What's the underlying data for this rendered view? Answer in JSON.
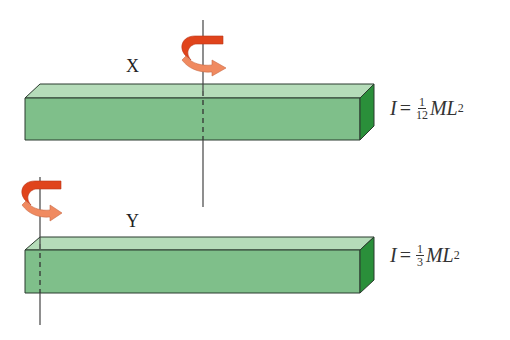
{
  "figure": {
    "colors": {
      "rod_front": "#7fbf8a",
      "rod_top": "#b5dcb9",
      "rod_end": "#2a8f3a",
      "rod_edge": "#2b3b2e",
      "arrow_dark": "#e0441c",
      "arrow_light": "#f08a60",
      "axis": "#444444"
    },
    "rods": [
      {
        "label": "X",
        "axis_position": "center",
        "formula": {
          "lhs": "I",
          "equals": "=",
          "numerator": "1",
          "denominator": "12",
          "rhs_base": "ML",
          "exponent": "2"
        }
      },
      {
        "label": "Y",
        "axis_position": "end",
        "formula": {
          "lhs": "I",
          "equals": "=",
          "numerator": "1",
          "denominator": "3",
          "rhs_base": "ML",
          "exponent": "2"
        }
      }
    ]
  }
}
